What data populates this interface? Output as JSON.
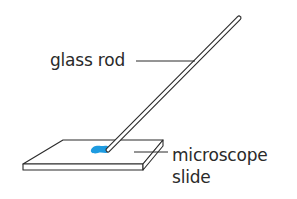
{
  "diagram": {
    "labels": {
      "glass_rod": "glass rod",
      "microscope_slide_line1": "microscope",
      "microscope_slide_line2": "slide"
    },
    "colors": {
      "line": "#2a2a2a",
      "drop": "#1e9be0",
      "background": "#ffffff"
    },
    "parts": [
      {
        "name": "glass rod",
        "description": "thin glass rod angled down to touch the slide"
      },
      {
        "name": "microscope slide",
        "description": "flat rectangular glass slide"
      },
      {
        "name": "drop",
        "description": "blue drop of liquid on the slide at the rod tip"
      }
    ]
  }
}
